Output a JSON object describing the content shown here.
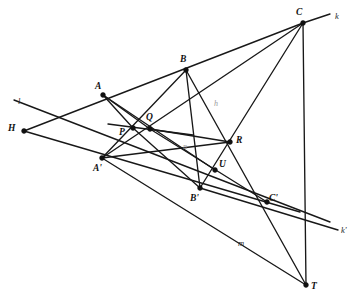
{
  "figure": {
    "background_color": "#ffffff",
    "stroke_color": "#181818",
    "width": 360,
    "height": 302
  },
  "points": [
    {
      "id": "H",
      "label": "H",
      "x": 24,
      "y": 131,
      "label_x": 8,
      "label_y": 124
    },
    {
      "id": "A",
      "label": "A",
      "x": 103,
      "y": 95,
      "label_x": 95,
      "label_y": 82
    },
    {
      "id": "B",
      "label": "B",
      "x": 186,
      "y": 70,
      "label_x": 180,
      "label_y": 55
    },
    {
      "id": "C",
      "label": "C",
      "x": 303,
      "y": 23,
      "label_x": 296,
      "label_y": 8
    },
    {
      "id": "P",
      "label": "P",
      "x": 133,
      "y": 128,
      "label_x": 119,
      "label_y": 128
    },
    {
      "id": "Q",
      "label": "Q",
      "x": 150,
      "y": 129,
      "label_x": 146,
      "label_y": 113
    },
    {
      "id": "R",
      "label": "R",
      "x": 230,
      "y": 142,
      "label_x": 236,
      "label_y": 136
    },
    {
      "id": "U",
      "label": "U",
      "x": 215,
      "y": 170,
      "label_x": 219,
      "label_y": 160
    },
    {
      "id": "A'",
      "label": "A'",
      "x": 102,
      "y": 158,
      "label_x": 93,
      "label_y": 164
    },
    {
      "id": "B'",
      "label": "B'",
      "x": 200,
      "y": 188,
      "label_x": 190,
      "label_y": 194
    },
    {
      "id": "C'",
      "label": "C'",
      "x": 267,
      "y": 202,
      "label_x": 269,
      "label_y": 194
    },
    {
      "id": "T",
      "label": "T",
      "x": 306,
      "y": 285,
      "label_x": 311,
      "label_y": 282
    }
  ],
  "line_labels": [
    {
      "id": "l",
      "label": "l",
      "x": 18,
      "y": 97,
      "faint": false
    },
    {
      "id": "k",
      "label": "k",
      "x": 335,
      "y": 12,
      "faint": false
    },
    {
      "id": "k'",
      "label": "k'",
      "x": 341,
      "y": 226,
      "faint": false
    },
    {
      "id": "m",
      "label": "m",
      "x": 238,
      "y": 239,
      "faint": false
    },
    {
      "id": "n",
      "label": "n",
      "x": 183,
      "y": 143,
      "faint": true
    },
    {
      "id": "h",
      "label": "h",
      "x": 214,
      "y": 100,
      "faint": true
    }
  ],
  "segments": [
    {
      "name": "line-l-through-A-prime-to-C-prime",
      "from": [
        14,
        100
      ],
      "to": [
        330,
        222
      ]
    },
    {
      "name": "line-k-through-C",
      "from": [
        303,
        23
      ],
      "to": [
        330,
        14
      ]
    },
    {
      "name": "line-H-to-A-extended-to-B-and-C",
      "from": [
        24,
        131
      ],
      "to": [
        303,
        23
      ]
    },
    {
      "name": "line-H-to-A-prime-extended-to-B-prime-C-prime",
      "from": [
        24,
        131
      ],
      "to": [
        300,
        212
      ]
    },
    {
      "name": "line-A-to-P",
      "from": [
        103,
        95
      ],
      "to": [
        133,
        128
      ]
    },
    {
      "name": "line-A-to-Q",
      "from": [
        103,
        95
      ],
      "to": [
        150,
        129
      ]
    },
    {
      "name": "line-A-to-U-through-Q",
      "from": [
        103,
        95
      ],
      "to": [
        215,
        170
      ]
    },
    {
      "name": "line-B-to-P-extended-to-A-prime",
      "from": [
        186,
        70
      ],
      "to": [
        102,
        158
      ]
    },
    {
      "name": "line-B-to-B-prime-through-R-area",
      "from": [
        186,
        70
      ],
      "to": [
        200,
        188
      ]
    },
    {
      "name": "line-B-to-T-through-R",
      "from": [
        186,
        70
      ],
      "to": [
        306,
        285
      ]
    },
    {
      "name": "line-C-to-P-extended-to-A-prime",
      "from": [
        303,
        23
      ],
      "to": [
        102,
        158
      ]
    },
    {
      "name": "line-C-to-Q-extended-to-B-prime",
      "from": [
        303,
        23
      ],
      "to": [
        200,
        188
      ]
    },
    {
      "name": "line-C-to-T-through-C-prime",
      "from": [
        303,
        23
      ],
      "to": [
        306,
        285
      ]
    },
    {
      "name": "line-A-prime-to-R-through-U",
      "from": [
        102,
        158
      ],
      "to": [
        230,
        142
      ]
    },
    {
      "name": "line-A-prime-to-T-through-B-prime",
      "from": [
        102,
        158
      ],
      "to": [
        306,
        285
      ]
    },
    {
      "name": "line-P-Q-extended-right",
      "from": [
        108,
        124
      ],
      "to": [
        193,
        135
      ]
    },
    {
      "name": "line-P-to-B-prime",
      "from": [
        133,
        128
      ],
      "to": [
        200,
        188
      ]
    },
    {
      "name": "line-Q-to-C-prime",
      "from": [
        150,
        129
      ],
      "to": [
        267,
        202
      ]
    },
    {
      "name": "line-B-prime-to-k-prime-through-C-prime",
      "from": [
        200,
        188
      ],
      "to": [
        338,
        230
      ]
    },
    {
      "name": "line-Q-to-R-segment",
      "from": [
        150,
        129
      ],
      "to": [
        230,
        142
      ]
    }
  ]
}
